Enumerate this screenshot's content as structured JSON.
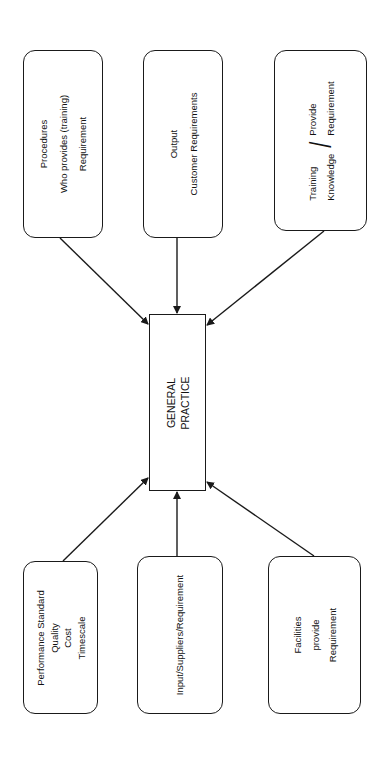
{
  "diagram": {
    "center": {
      "lines": [
        "GENERAL",
        "PRACTICE"
      ]
    },
    "top_boxes": [
      {
        "id": "procedures",
        "lines": [
          "Procedures",
          "Who provides (training)",
          "Requirement"
        ]
      },
      {
        "id": "output",
        "lines": [
          "Output",
          "Customer Requirements"
        ]
      },
      {
        "id": "training",
        "left_lines": [
          "Training",
          "Knowledge"
        ],
        "separator": "/",
        "right_lines": [
          "Provide",
          "Requirement"
        ]
      }
    ],
    "bottom_boxes": [
      {
        "id": "performance",
        "lines": [
          "Performance Standard",
          "Quality",
          "Cost",
          "Timescale"
        ]
      },
      {
        "id": "input",
        "lines": [
          "Input/Suppliers/Requirement"
        ]
      },
      {
        "id": "facilities",
        "lines": [
          "Facilities",
          "provide",
          "Requirement"
        ]
      }
    ],
    "arrows": [
      {
        "from": "procedures",
        "to": "center"
      },
      {
        "from": "output",
        "to": "center"
      },
      {
        "from": "training",
        "to": "center"
      },
      {
        "from": "performance",
        "to": "center"
      },
      {
        "from": "input",
        "to": "center"
      },
      {
        "from": "facilities",
        "to": "center"
      }
    ],
    "colors": {
      "line": "#1a1a1a",
      "background": "#ffffff"
    }
  }
}
